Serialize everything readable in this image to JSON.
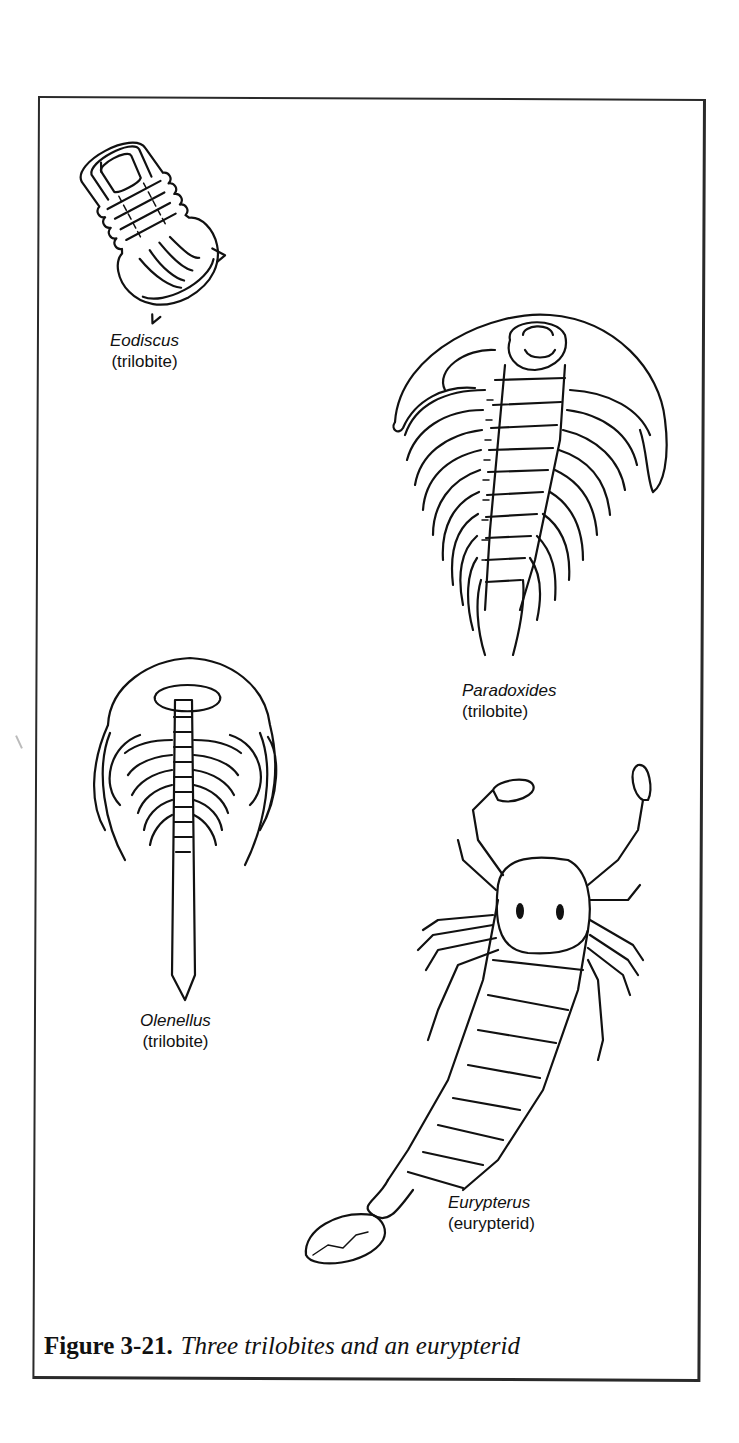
{
  "figure": {
    "number": "Figure 3-21.",
    "caption": "Three trilobites and an eurypterid"
  },
  "specimens": [
    {
      "genus": "Eodiscus",
      "group": "(trilobite)"
    },
    {
      "genus": "Paradoxides",
      "group": "(trilobite)"
    },
    {
      "genus": "Olenellus",
      "group": "(trilobite)"
    },
    {
      "genus": "Eurypterus",
      "group": "(eurypterid)"
    }
  ]
}
